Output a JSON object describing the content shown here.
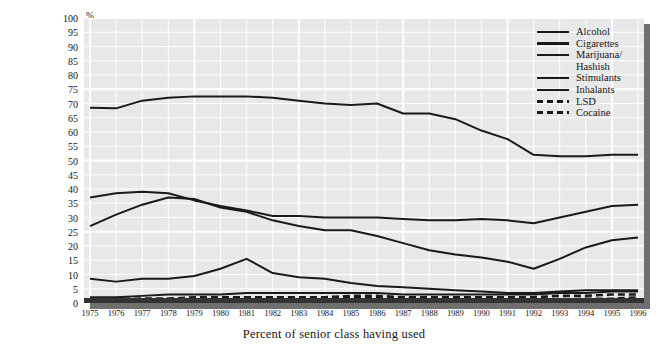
{
  "axis": {
    "percent_symbol": "%",
    "ylabel": "Percentage of 16- and 17-year-old students working during school year",
    "xlabel": "Percent of senior class having used",
    "yticks": [
      0,
      5,
      10,
      15,
      20,
      25,
      30,
      35,
      40,
      45,
      50,
      55,
      60,
      65,
      70,
      75,
      80,
      85,
      90,
      95,
      100
    ],
    "xticks": [
      1975,
      1976,
      1977,
      1978,
      1979,
      1980,
      1981,
      1982,
      1983,
      1984,
      1985,
      1986,
      1987,
      1988,
      1989,
      1990,
      1991,
      1992,
      1993,
      1994,
      1995,
      1996
    ]
  },
  "legend": {
    "entries": [
      {
        "label": "Alcohol",
        "style": "solid",
        "color": "#1a1a1a",
        "continuation": ""
      },
      {
        "label": "Cigarettes",
        "style": "solid",
        "color": "#1a1a1a",
        "continuation": ""
      },
      {
        "label": "Marijuana/",
        "style": "solid",
        "color": "#1a1a1a",
        "continuation": "Hashish"
      },
      {
        "label": "Stimulants",
        "style": "solid",
        "color": "#1a1a1a",
        "continuation": ""
      },
      {
        "label": "Inhalants",
        "style": "solid",
        "color": "#1a1a1a",
        "continuation": ""
      },
      {
        "label": "LSD",
        "style": "dashed",
        "color": "#1a1a1a",
        "continuation": ""
      },
      {
        "label": "Cocaine",
        "style": "dashed",
        "color": "#1a1a1a",
        "continuation": ""
      }
    ]
  },
  "chart_data": {
    "type": "line",
    "title": "",
    "xlabel": "Percent of senior class having used",
    "ylabel": "Percentage of 16- and 17-year-old students working during school year",
    "xlim": [
      1975,
      1996
    ],
    "ylim": [
      0,
      100
    ],
    "grid": true,
    "legend_position": "top-right",
    "x": [
      1975,
      1976,
      1977,
      1978,
      1979,
      1980,
      1981,
      1982,
      1983,
      1984,
      1985,
      1986,
      1987,
      1988,
      1989,
      1990,
      1991,
      1992,
      1993,
      1994,
      1995,
      1996
    ],
    "series": [
      {
        "name": "Alcohol",
        "style": "solid",
        "color": "#1a1a1a",
        "values": [
          68.5,
          68.3,
          71.0,
          72.0,
          72.5,
          72.5,
          72.5,
          72.0,
          71.0,
          70.0,
          69.5,
          70.0,
          66.5,
          66.5,
          64.5,
          60.5,
          57.5,
          52.0,
          51.5,
          51.5,
          52.0,
          52.0
        ]
      },
      {
        "name": "Cigarettes",
        "style": "solid",
        "color": "#1a1a1a",
        "values": [
          37.0,
          38.5,
          39.0,
          38.5,
          36.0,
          34.0,
          32.5,
          30.5,
          30.5,
          30.0,
          30.0,
          30.0,
          29.5,
          29.0,
          29.0,
          29.5,
          29.0,
          28.0,
          30.0,
          32.0,
          34.0,
          34.5
        ]
      },
      {
        "name": "Marijuana/Hashish",
        "style": "solid",
        "color": "#1a1a1a",
        "values": [
          27.0,
          31.0,
          34.5,
          37.0,
          36.5,
          33.5,
          32.0,
          29.0,
          27.0,
          25.5,
          25.5,
          23.5,
          21.0,
          18.5,
          17.0,
          16.0,
          14.5,
          12.0,
          15.5,
          19.5,
          22.0,
          23.0
        ]
      },
      {
        "name": "Stimulants",
        "style": "solid",
        "color": "#1a1a1a",
        "values": [
          8.5,
          7.5,
          8.5,
          8.5,
          9.5,
          12.0,
          15.5,
          10.5,
          9.0,
          8.5,
          7.0,
          6.0,
          5.5,
          5.0,
          4.5,
          4.0,
          3.5,
          3.5,
          4.0,
          4.5,
          4.5,
          4.5
        ]
      },
      {
        "name": "Inhalants",
        "style": "solid",
        "color": "#1a1a1a",
        "values": [
          2.0,
          2.0,
          2.5,
          3.0,
          3.0,
          3.0,
          3.5,
          3.5,
          3.5,
          3.5,
          3.5,
          3.5,
          3.0,
          3.0,
          3.0,
          3.0,
          3.0,
          3.0,
          3.5,
          3.5,
          4.0,
          4.0
        ]
      },
      {
        "name": "LSD",
        "style": "dashed",
        "color": "#1a1a1a",
        "values": [
          1.5,
          1.5,
          1.5,
          1.5,
          1.5,
          1.5,
          2.0,
          2.0,
          2.0,
          2.0,
          2.0,
          2.0,
          2.0,
          2.0,
          2.0,
          2.0,
          2.0,
          2.0,
          2.5,
          2.5,
          3.0,
          3.0
        ]
      },
      {
        "name": "Cocaine",
        "style": "dashed",
        "color": "#1a1a1a",
        "values": [
          1.0,
          1.0,
          1.5,
          1.5,
          2.0,
          2.0,
          2.0,
          2.0,
          2.0,
          2.0,
          2.5,
          2.5,
          2.0,
          1.5,
          1.5,
          1.0,
          1.0,
          1.0,
          1.0,
          1.5,
          1.5,
          2.0
        ]
      }
    ]
  }
}
